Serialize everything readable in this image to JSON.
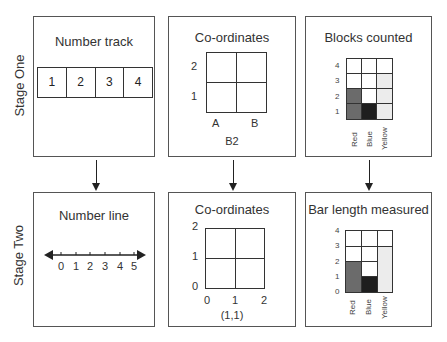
{
  "stages": {
    "one": "Stage One",
    "two": "Stage Two"
  },
  "panels": {
    "number_track": {
      "title": "Number track",
      "cells": [
        "1",
        "2",
        "3",
        "4"
      ]
    },
    "coordinates_one": {
      "title": "Co-ordinates",
      "y_labels": [
        "2",
        "1"
      ],
      "x_labels": [
        "A",
        "B"
      ],
      "caption": "B2"
    },
    "blocks_counted": {
      "title": "Blocks counted",
      "y_labels": [
        "4",
        "3",
        "2",
        "1"
      ],
      "categories": [
        "Red",
        "Blue",
        "Yellow"
      ],
      "values": [
        2,
        1,
        3
      ]
    },
    "number_line": {
      "title": "Number line",
      "ticks": [
        "0",
        "1",
        "2",
        "3",
        "4",
        "5"
      ]
    },
    "coordinates_two": {
      "title": "Co-ordinates",
      "y_labels": [
        "2",
        "1",
        "0"
      ],
      "x_labels": [
        "0",
        "1",
        "2"
      ],
      "caption": "(1,1)"
    },
    "bar_length": {
      "title": "Bar length measured",
      "y_labels": [
        "4",
        "3",
        "2",
        "1",
        "0"
      ],
      "categories": [
        "Red",
        "Blue",
        "Yellow"
      ],
      "values": [
        2,
        1,
        3
      ]
    }
  },
  "colors": {
    "red": "#6b6b6b",
    "blue": "#1e1e1e",
    "yellow": "#ececec"
  }
}
